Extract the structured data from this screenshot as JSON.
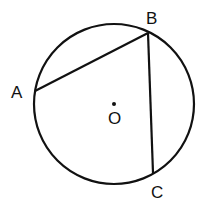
{
  "diagram": {
    "type": "circle-geometry",
    "circle": {
      "center_label": "O",
      "cx": 114,
      "cy": 104,
      "r": 80
    },
    "points": [
      {
        "name": "A",
        "x": 35,
        "y": 91,
        "label_x": 11,
        "label_y": 98
      },
      {
        "name": "B",
        "x": 148,
        "y": 33,
        "label_x": 146,
        "label_y": 24
      },
      {
        "name": "C",
        "x": 153,
        "y": 173,
        "label_x": 151,
        "label_y": 198
      }
    ],
    "center": {
      "name": "O",
      "label_x": 108,
      "label_y": 124
    },
    "chords": [
      "AB",
      "BC"
    ],
    "colors": {
      "stroke": "#111111",
      "background": "#ffffff"
    }
  }
}
